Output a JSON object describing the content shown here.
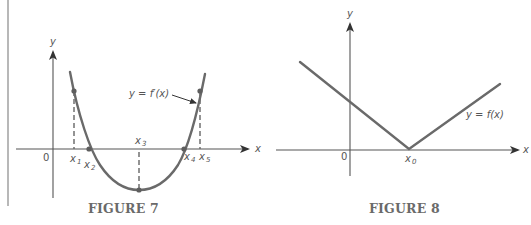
{
  "figures": [
    {
      "id": "figure-7",
      "caption": "FIGURE 7",
      "axes": {
        "x_label": "x",
        "y_label": "y",
        "origin_label": "0"
      },
      "curve_label": "y = f′(x)",
      "points": [
        {
          "label": "x",
          "sub": "1"
        },
        {
          "label": "x",
          "sub": "2"
        },
        {
          "label": "x",
          "sub": "3"
        },
        {
          "label": "x",
          "sub": "4"
        },
        {
          "label": "x",
          "sub": "5"
        }
      ]
    },
    {
      "id": "figure-8",
      "caption": "FIGURE 8",
      "axes": {
        "x_label": "x",
        "y_label": "y",
        "origin_label": "0"
      },
      "curve_label": "y = f(x)",
      "points": [
        {
          "label": "x",
          "sub": "0"
        }
      ]
    }
  ],
  "colors": {
    "curve": "#6a6a6a",
    "axis": "#555555",
    "caption": "#6a6a6a"
  }
}
